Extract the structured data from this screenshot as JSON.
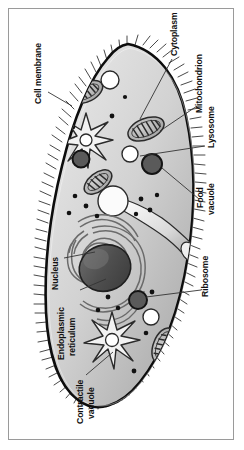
{
  "figure": {
    "style": "grayscale line drawing",
    "frame_color": "#9a9a9a",
    "background": "#ffffff"
  },
  "palette": {
    "membrane_line": "#111111",
    "cytoplasm_light": "#e2e2e2",
    "cytoplasm_mid": "#c9c9c9",
    "cytoplasm_dark": "#a9a9a9",
    "organelle_outline": "#2b2b2b",
    "mitochondrion_fill": "#b4b4b4",
    "nucleus_dark": "#4a4a4a",
    "nucleus_light": "#9b9b9b",
    "food_vacuole_fill": "#5a5a5a",
    "lysosome_fill": "#ffffff",
    "ribosome_fill": "#111111",
    "leader_line": "#333333"
  },
  "labels": [
    {
      "id": "cell-membrane",
      "text": "Cell membrane",
      "lines": [
        "Cell membrane"
      ],
      "side": "left",
      "rotation": -90
    },
    {
      "id": "cytoplasm",
      "text": "Cytoplasm",
      "lines": [
        "Cytoplasm"
      ],
      "side": "right",
      "rotation": -90
    },
    {
      "id": "mitochondrion",
      "text": "Mitochondrion",
      "lines": [
        "Mitochondrion"
      ],
      "side": "right",
      "rotation": -90
    },
    {
      "id": "lysosome",
      "text": "Lysosome",
      "lines": [
        "Lysosome"
      ],
      "side": "right",
      "rotation": -90
    },
    {
      "id": "food-vacuole",
      "text": "Food vacuole",
      "lines": [
        "Food",
        "vacuole"
      ],
      "side": "right",
      "rotation": -90
    },
    {
      "id": "ribosome",
      "text": "Ribosome",
      "lines": [
        "Ribosome"
      ],
      "side": "right",
      "rotation": -90
    },
    {
      "id": "nucleus",
      "text": "Nucleus",
      "lines": [
        "Nucleus"
      ],
      "side": "left",
      "rotation": -90
    },
    {
      "id": "endoplasmic-reticulum",
      "text": "Endoplasmic reticulum",
      "lines": [
        "Endoplasmic",
        "reticulum"
      ],
      "side": "left",
      "rotation": -90
    },
    {
      "id": "contractile-vacuole",
      "text": "Contractile vacuole",
      "lines": [
        "Contractile",
        "vacuole"
      ],
      "side": "left",
      "rotation": -90
    }
  ],
  "organelles": {
    "mitochondria_count": 4,
    "contractile_vacuoles_count": 2,
    "food_vacuoles_count": 3,
    "lysosomes_count": 3,
    "ribosome_dots_count": 18,
    "nucleus_count": 1,
    "oral_groove": true,
    "cilia": true
  }
}
